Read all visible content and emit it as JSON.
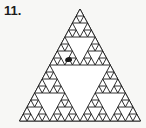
{
  "page": {
    "background_color": "#f7f7f5",
    "width": 146,
    "height": 128
  },
  "problem": {
    "number_label": "11."
  },
  "figure": {
    "name": "sierpinski-triangle",
    "depth": 4,
    "stroke_color": "#1a1a1a",
    "fill_color": "#ffffff",
    "stroke_width": 0.9,
    "apex": {
      "x": 80,
      "y": 9
    },
    "base_left": {
      "x": 19.5,
      "y": 121
    },
    "base_right": {
      "x": 140.5,
      "y": 121
    },
    "ink_blob": {
      "visible": true,
      "x": 65,
      "y": 57,
      "width": 7,
      "height": 5,
      "color": "#1a1a1a"
    }
  }
}
